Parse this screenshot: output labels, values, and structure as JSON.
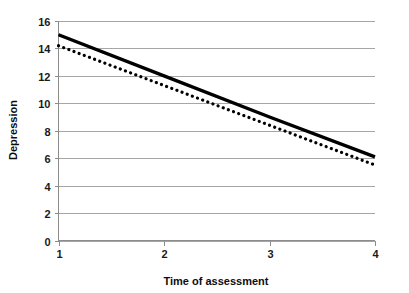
{
  "chart_data": {
    "type": "line",
    "title": "",
    "xlabel": "Time of assessment",
    "ylabel": "Depression",
    "xlim": [
      1,
      4
    ],
    "ylim": [
      0,
      16
    ],
    "grid": true,
    "grid_axis": "y",
    "legend": "none",
    "x": [
      1,
      2,
      3,
      4
    ],
    "xticks": [
      "1",
      "2",
      "3",
      "4"
    ],
    "yticks": [
      "0",
      "2",
      "4",
      "6",
      "8",
      "10",
      "12",
      "14",
      "16"
    ],
    "ytick_values": [
      0,
      2,
      4,
      6,
      8,
      10,
      12,
      14,
      16
    ],
    "series": [
      {
        "name": "solid-line",
        "style": "solid",
        "color": "#000000",
        "values": [
          15.0,
          12.0,
          9.0,
          6.1
        ]
      },
      {
        "name": "dotted-line",
        "style": "dotted",
        "color": "#000000",
        "values": [
          14.2,
          11.3,
          8.4,
          5.5
        ]
      }
    ]
  },
  "axes": {
    "y_label": "Depression",
    "x_label": "Time of assessment",
    "y_tick_labels": [
      "16",
      "14",
      "12",
      "10",
      "8",
      "6",
      "4",
      "2",
      "0"
    ],
    "x_tick_labels": [
      "1",
      "2",
      "3",
      "4"
    ]
  },
  "colors": {
    "line": "#000000",
    "grid": "#a6a6a6",
    "axis": "#8c8c8c",
    "text": "#1a1a1a",
    "background": "#ffffff"
  }
}
